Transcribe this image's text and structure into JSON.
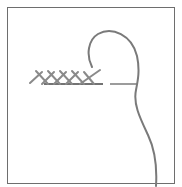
{
  "illustration": {
    "subject": "embroidery stitch diagram",
    "stitch_count": 4,
    "colors": {
      "border": "#6e6e6e",
      "thread": "#7a7a7a",
      "stitch": "#8a8a8a",
      "guide_line": "#555555"
    }
  }
}
